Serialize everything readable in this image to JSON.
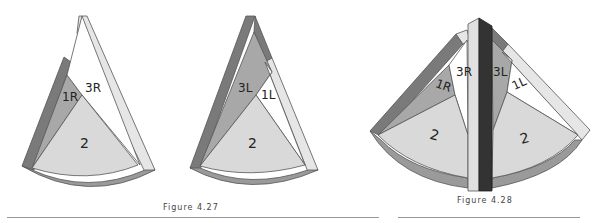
{
  "figures": [
    {
      "caption": "Figure 4.27",
      "panels": [
        {
          "labels": {
            "r1": "1R",
            "r3": "3R",
            "center": "2"
          }
        },
        {
          "labels": {
            "l3": "3L",
            "l1": "1L",
            "center": "2"
          }
        }
      ]
    },
    {
      "caption": "Figure 4.28",
      "labels": {
        "r3": "3R",
        "r1": "1R",
        "l3": "3L",
        "l1": "1L",
        "center_left": "2",
        "center_right": "2"
      }
    }
  ],
  "colors": {
    "dark": "#7a7a7a",
    "mid": "#a8a8a8",
    "light": "#d9d9d9",
    "pale": "#ececec",
    "black_bar": "#333333",
    "outline": "#555555"
  }
}
